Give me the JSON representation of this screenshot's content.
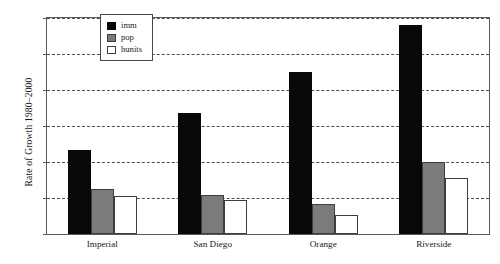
{
  "chart_data": {
    "type": "bar",
    "title": "",
    "xlabel": "",
    "ylabel": "Rate of Growth 1980–2000",
    "categories": [
      "Imperial",
      "San Diego",
      "Orange",
      "Riverside"
    ],
    "series": [
      {
        "name": "imm",
        "color": "#080808",
        "values": [
          117,
          168,
          225,
          290
        ]
      },
      {
        "name": "pop",
        "color": "#7b7b7b",
        "values": [
          62,
          54,
          41,
          100
        ]
      },
      {
        "name": "hunits",
        "color": "#ffffff",
        "values": [
          53,
          47,
          26,
          78
        ]
      }
    ],
    "ylim": [
      0,
      300
    ],
    "yticks": [
      0,
      50,
      100,
      150,
      200,
      250,
      300
    ],
    "ytick_labels": [
      "0%",
      "50%",
      "100%",
      "150%",
      "200%",
      "250%",
      "300%"
    ],
    "grid": true,
    "legend_position": "top-center",
    "value_suffix": "%"
  }
}
